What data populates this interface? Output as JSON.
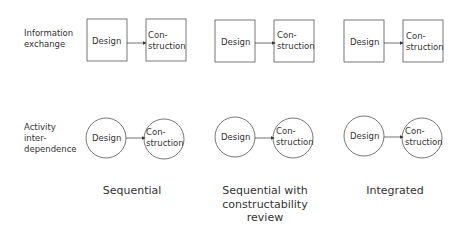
{
  "row_labels": {
    "information_exchange": [
      "Information",
      "exchange"
    ],
    "activity_interdependence": [
      "Activity",
      "inter-",
      "dependence"
    ]
  },
  "node_labels": {
    "design": "Design",
    "construction_line1": "Con-",
    "construction_line2": "struction"
  },
  "columns": [
    {
      "caption": [
        "Sequential"
      ]
    },
    {
      "caption": [
        "Sequential with",
        "constructability",
        "review"
      ]
    },
    {
      "caption": [
        "Integrated"
      ]
    }
  ],
  "colors": {
    "stroke": "#555555",
    "text": "#333333",
    "background": "#ffffff"
  }
}
